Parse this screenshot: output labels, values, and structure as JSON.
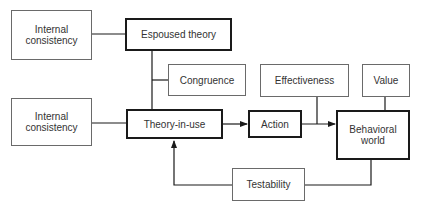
{
  "diagram": {
    "nodes": {
      "internal_consistency_top": "Internal\nconsistency",
      "espoused_theory": "Espoused theory",
      "congruence": "Congruence",
      "effectiveness": "Effectiveness",
      "value": "Value",
      "internal_consistency_bottom": "Internal\nconsistency",
      "theory_in_use": "Theory-in-use",
      "action": "Action",
      "behavioral_world": "Behavioral\nworld",
      "testability": "Testability"
    },
    "edges": [
      {
        "from": "internal_consistency_top",
        "to": "espoused_theory",
        "type": "line"
      },
      {
        "from": "espoused_theory",
        "to": "theory_in_use",
        "type": "line"
      },
      {
        "from": "congruence",
        "to": "espoused_theory-theory_in_use link",
        "type": "line"
      },
      {
        "from": "internal_consistency_bottom",
        "to": "theory_in_use",
        "type": "line"
      },
      {
        "from": "theory_in_use",
        "to": "action",
        "type": "arrow"
      },
      {
        "from": "action",
        "to": "behavioral_world",
        "type": "arrow"
      },
      {
        "from": "effectiveness",
        "to": "action-behavioral_world link",
        "type": "line"
      },
      {
        "from": "value",
        "to": "behavioral_world",
        "type": "line"
      },
      {
        "from": "behavioral_world",
        "to": "testability",
        "type": "line"
      },
      {
        "from": "testability",
        "to": "theory_in_use",
        "type": "arrow"
      }
    ]
  }
}
